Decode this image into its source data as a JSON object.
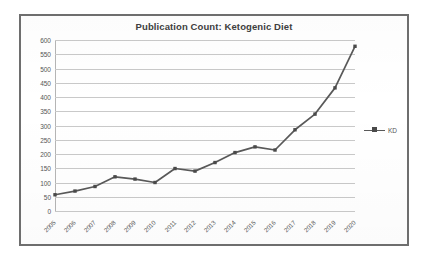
{
  "chart_data": {
    "type": "line",
    "title": "Publication Count: Ketogenic Diet",
    "xlabel": "",
    "ylabel": "",
    "ylim": [
      0,
      600
    ],
    "ytick_step": 50,
    "grid": true,
    "legend_position": "right",
    "categories": [
      "2005",
      "2006",
      "2007",
      "2008",
      "2009",
      "2010",
      "2011",
      "2012",
      "2013",
      "2014",
      "2015",
      "2016",
      "2017",
      "2018",
      "2019",
      "2020"
    ],
    "series": [
      {
        "name": "KD",
        "values": [
          57,
          70,
          86,
          120,
          112,
          100,
          149,
          140,
          170,
          205,
          225,
          214,
          285,
          340,
          432,
          578
        ]
      }
    ],
    "yticks": [
      "0",
      "50",
      "100",
      "150",
      "200",
      "250",
      "300",
      "350",
      "400",
      "450",
      "500",
      "550",
      "600"
    ],
    "colors": {
      "series_line": "#595959",
      "marker": "#4a4a4a",
      "gridline": "#c9c9c9",
      "border": "#6e6e6e",
      "text": "#555555",
      "title": "#404040",
      "background": "#ffffff"
    }
  },
  "legend": {
    "entries": [
      {
        "label": "KD",
        "marker": "square-marker"
      }
    ]
  }
}
